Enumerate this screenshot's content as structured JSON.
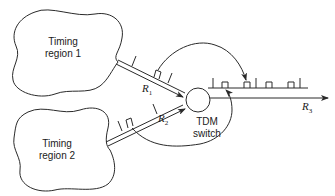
{
  "diagram": {
    "regions": [
      {
        "id": "region1",
        "line1": "Timing",
        "line2": "region 1"
      },
      {
        "id": "region2",
        "line1": "Timing",
        "line2": "region 2"
      }
    ],
    "switch": {
      "line1": "TDM",
      "line2": "switch"
    },
    "links": [
      {
        "id": "r1",
        "label": "R",
        "sub": "1"
      },
      {
        "id": "r2",
        "label": "R",
        "sub": "2"
      },
      {
        "id": "r3",
        "label": "R",
        "sub": "3"
      }
    ],
    "colors": {
      "stroke": "#2a2a2a",
      "background": "#ffffff"
    }
  }
}
